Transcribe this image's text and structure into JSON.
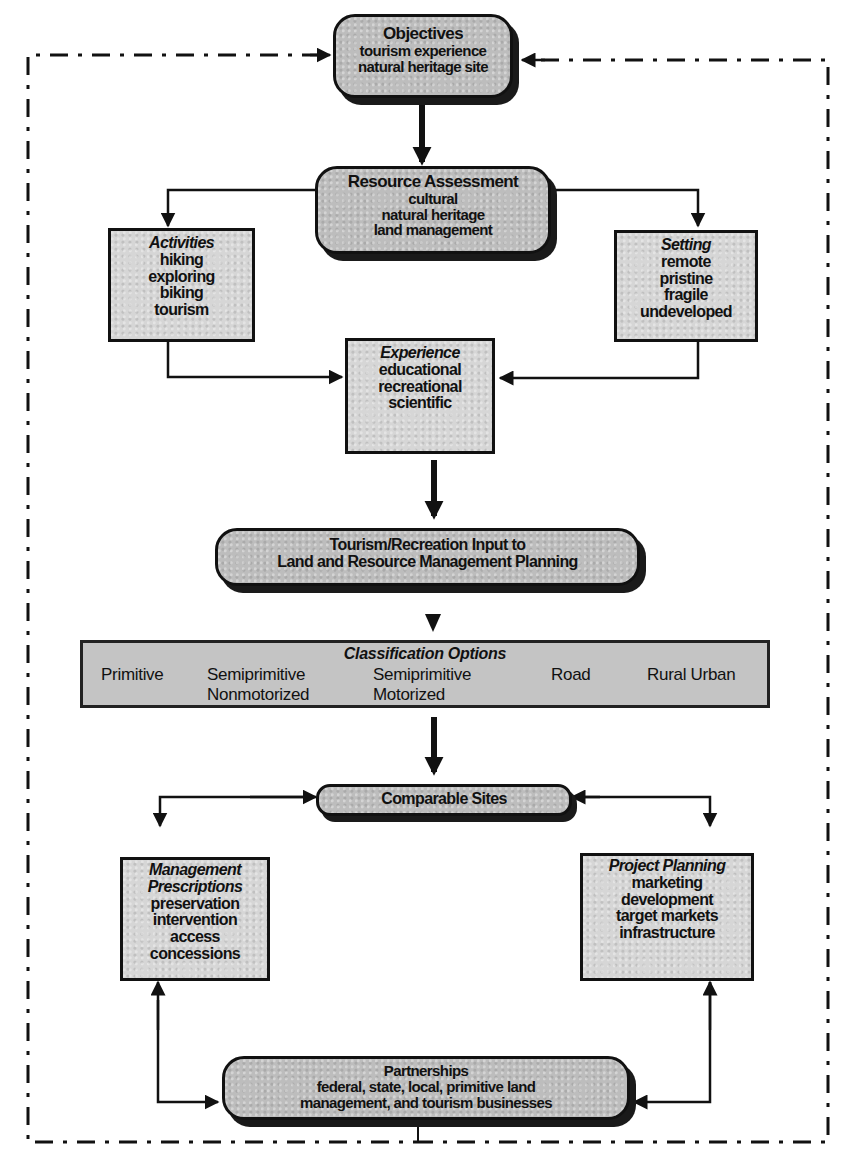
{
  "diagram": {
    "frame_style": "dash-dot outer border",
    "nodes": {
      "objectives": {
        "title": "Objectives",
        "lines": [
          "tourism experience",
          "natural heritage site"
        ]
      },
      "resource_assessment": {
        "title": "Resource Assessment",
        "lines": [
          "cultural",
          "natural heritage",
          "land management"
        ]
      },
      "activities": {
        "title": "Activities",
        "lines": [
          "hiking",
          "exploring",
          "biking",
          "tourism"
        ]
      },
      "setting": {
        "title": "Setting",
        "lines": [
          "remote",
          "pristine",
          "fragile",
          "undeveloped"
        ]
      },
      "experience": {
        "title": "Experience",
        "lines": [
          "educational",
          "recreational",
          "scientific"
        ]
      },
      "tourism_input": {
        "lines": [
          "Tourism/Recreation Input to",
          "Land and Resource Management Planning"
        ]
      },
      "classification": {
        "title": "Classification Options",
        "options": [
          {
            "line1": "Primitive",
            "line2": ""
          },
          {
            "line1": "Semiprimitive",
            "line2": "Nonmotorized"
          },
          {
            "line1": "Semiprimitive",
            "line2": "Motorized"
          },
          {
            "line1": "Road",
            "line2": ""
          },
          {
            "line1": "Rural Urban",
            "line2": ""
          }
        ]
      },
      "comparable_sites": {
        "title": "Comparable Sites"
      },
      "management_prescriptions": {
        "title_line1": "Management",
        "title_line2": "Prescriptions",
        "lines": [
          "preservation",
          "intervention",
          "access",
          "concessions"
        ]
      },
      "project_planning": {
        "title": "Project Planning",
        "lines": [
          "marketing",
          "development",
          "target markets",
          "infrastructure"
        ]
      },
      "partnerships": {
        "title": "Partnerships",
        "lines": [
          "federal, state, local, primitive land",
          "management,  and tourism businesses"
        ]
      }
    },
    "edges": [
      {
        "from": "objectives",
        "to": "resource_assessment",
        "style": "thick-arrow"
      },
      {
        "from": "resource_assessment",
        "to": "activities",
        "style": "line-arrow"
      },
      {
        "from": "resource_assessment",
        "to": "setting",
        "style": "line-arrow"
      },
      {
        "from": "activities",
        "to": "experience",
        "style": "line-arrow"
      },
      {
        "from": "setting",
        "to": "experience",
        "style": "line-arrow"
      },
      {
        "from": "experience",
        "to": "tourism_input",
        "style": "thick-arrow"
      },
      {
        "from": "tourism_input",
        "to": "classification",
        "style": "triangle"
      },
      {
        "from": "classification",
        "to": "comparable_sites",
        "style": "thick-arrow"
      },
      {
        "from": "comparable_sites",
        "to": "management_prescriptions",
        "style": "bidirectional"
      },
      {
        "from": "comparable_sites",
        "to": "project_planning",
        "style": "bidirectional"
      },
      {
        "from": "management_prescriptions",
        "to": "partnerships",
        "style": "bidirectional"
      },
      {
        "from": "project_planning",
        "to": "partnerships",
        "style": "bidirectional"
      },
      {
        "from": "partnerships",
        "to": "objectives",
        "style": "dashed-feedback-loop"
      }
    ]
  }
}
